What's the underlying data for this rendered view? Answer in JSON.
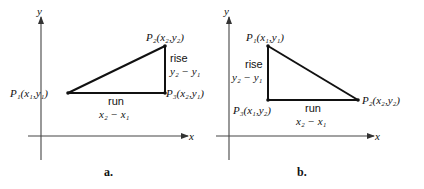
{
  "panels": [
    {
      "id": "a",
      "caption": "a.",
      "axes": {
        "x_label": "x",
        "y_label": "y"
      },
      "points": {
        "P1": "P₁(x₁,y₁)",
        "P2": "P₂(x₂,y₂)",
        "P3": "P₃(x₂,y₁)"
      },
      "rise": {
        "word": "rise",
        "expr": "y₂ − y₁"
      },
      "run": {
        "word": "run",
        "expr": "x₂ − x₁"
      }
    },
    {
      "id": "b",
      "caption": "b.",
      "axes": {
        "x_label": "x",
        "y_label": "y"
      },
      "points": {
        "P1": "P₁(x₁,y₁)",
        "P2": "P₂(x₂,y₂)",
        "P3": "P₃(x₁,y₂)"
      },
      "rise": {
        "word": "rise",
        "expr": "y₂ − y₁"
      },
      "run": {
        "word": "run",
        "expr": "x₂ − x₁"
      }
    }
  ]
}
